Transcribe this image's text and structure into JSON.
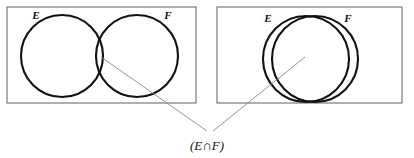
{
  "figure": {
    "caption": {
      "open_paren": "(",
      "left_set": "E",
      "operator": "∩",
      "right_set": "F",
      "close_paren": ")",
      "full_text": "(E∩F)"
    },
    "colors": {
      "background": "#ffffff",
      "frame_stroke": "#6e6e6e",
      "circle_stroke": "#111111",
      "leader_stroke": "#8a8a8a",
      "text": "#111111"
    },
    "panels": [
      {
        "id": "left-panel",
        "name": "partially-overlapping-sets",
        "frame": {
          "x": 7,
          "y": 7,
          "width": 189,
          "height": 96
        },
        "circles": [
          {
            "label": "E",
            "cx": 62,
            "cy": 56,
            "r": 41
          },
          {
            "label": "F",
            "cx": 137,
            "cy": 56,
            "r": 41
          }
        ],
        "labels": [
          {
            "text": "E",
            "x": 36,
            "y": 19
          },
          {
            "text": "F",
            "x": 168,
            "y": 19
          }
        ],
        "leader": {
          "x1": 101,
          "y1": 57,
          "x2": 207,
          "y2": 131
        }
      },
      {
        "id": "right-panel",
        "name": "nearly-coincident-sets",
        "frame": {
          "x": 217,
          "y": 7,
          "width": 185,
          "height": 96
        },
        "circles": [
          {
            "label": "E",
            "cx": 306,
            "cy": 59,
            "r": 43
          },
          {
            "label": "F",
            "cx": 315,
            "cy": 59,
            "r": 43
          }
        ],
        "labels": [
          {
            "text": "E",
            "x": 268,
            "y": 22
          },
          {
            "text": "F",
            "x": 348,
            "y": 22
          }
        ],
        "leader": {
          "x1": 305,
          "y1": 57,
          "x2": 213,
          "y2": 131
        }
      }
    ],
    "caption_position": {
      "x": 207,
      "y": 147
    }
  }
}
